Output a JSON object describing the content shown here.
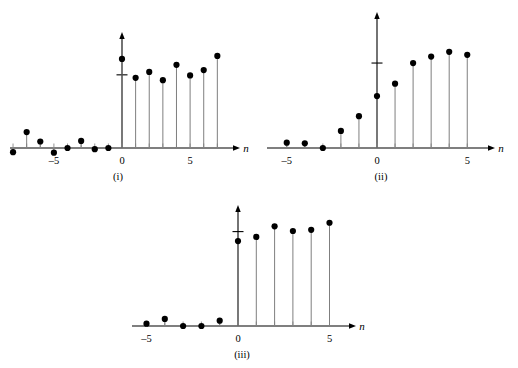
{
  "figure": {
    "type": "stem-plot-group",
    "axis_label": "n",
    "background_color": "#ffffff",
    "marker_color": "#000000",
    "stem_color": "#7f7f7f",
    "axis_color": "#000000"
  },
  "chart_data": [
    {
      "type": "scatter",
      "subtype": "stem",
      "name": "plot-i",
      "caption": "(i)",
      "title": "",
      "xlabel": "n",
      "ylabel": "",
      "xlim": [
        -9.2,
        8.6
      ],
      "ylim": [
        -0.12,
        1.05
      ],
      "xticks": [
        -5,
        0,
        5
      ],
      "xticklabels": [
        "–5",
        "0",
        "5"
      ],
      "yticks": [
        0.62
      ],
      "yticklabels": [
        ""
      ],
      "grid": false,
      "legend": false,
      "x": [
        -8,
        -7,
        -6,
        -5,
        -4,
        -3,
        -2,
        -1,
        0,
        1,
        2,
        3,
        4,
        5,
        6,
        7
      ],
      "values": [
        -0.035,
        0.135,
        0.055,
        -0.04,
        0.0,
        0.06,
        -0.01,
        0.0,
        0.755,
        0.595,
        0.645,
        0.575,
        0.705,
        0.615,
        0.66,
        0.78
      ]
    },
    {
      "type": "scatter",
      "subtype": "stem",
      "name": "plot-ii",
      "caption": "(ii)",
      "title": "",
      "xlabel": "n",
      "ylabel": "",
      "xlim": [
        -6.2,
        6.4
      ],
      "ylim": [
        -0.08,
        1.05
      ],
      "xticks": [
        -5,
        0,
        5
      ],
      "xticklabels": [
        "–5",
        "0",
        "5"
      ],
      "yticks": [
        0.72
      ],
      "yticklabels": [
        ""
      ],
      "grid": false,
      "legend": false,
      "x": [
        -5,
        -4,
        -3,
        -2,
        -1,
        0,
        1,
        2,
        3,
        4,
        5
      ],
      "values": [
        0.045,
        0.04,
        0.0,
        0.145,
        0.27,
        0.44,
        0.545,
        0.72,
        0.775,
        0.815,
        0.79
      ]
    },
    {
      "type": "scatter",
      "subtype": "stem",
      "name": "plot-iii",
      "caption": "(iii)",
      "title": "",
      "xlabel": "n",
      "ylabel": "",
      "xlim": [
        -6.2,
        6.4
      ],
      "ylim": [
        -0.08,
        1.05
      ],
      "xticks": [
        -5,
        0,
        5
      ],
      "xticklabels": [
        "–5",
        "0",
        "5"
      ],
      "yticks": [
        0.8
      ],
      "yticklabels": [
        ""
      ],
      "grid": false,
      "legend": false,
      "x": [
        -5,
        -4,
        -3,
        -2,
        -1,
        0,
        1,
        2,
        3,
        4,
        5
      ],
      "values": [
        0.02,
        0.06,
        0.0,
        0.0,
        0.045,
        0.72,
        0.755,
        0.845,
        0.805,
        0.815,
        0.875
      ]
    }
  ],
  "captions": {
    "one": "(i)",
    "two": "(ii)",
    "three": "(iii)"
  }
}
